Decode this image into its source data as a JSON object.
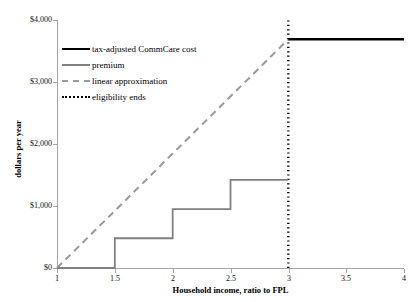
{
  "chart_data": {
    "type": "line",
    "title": "",
    "xlabel": "Household income, ratio to FPL",
    "ylabel": "dollars per year",
    "xlim": [
      1,
      4
    ],
    "ylim": [
      0,
      4000
    ],
    "grid": false,
    "legend_position": "upper-left-inside",
    "x_ticks": [
      "1",
      "1.5",
      "2",
      "2.5",
      "3",
      "3.5",
      "4"
    ],
    "x_tick_values": [
      1,
      1.5,
      2,
      2.5,
      3,
      3.5,
      4
    ],
    "y_ticks": [
      "$0",
      "$1,000",
      "$2,000",
      "$3,000",
      "$4,000"
    ],
    "y_tick_values": [
      0,
      1000,
      2000,
      3000,
      4000
    ],
    "series": [
      {
        "name": "tax-adjusted CommCare cost",
        "style": "solid-thick",
        "color": "#000000",
        "points": [
          [
            3,
            3690
          ],
          [
            4,
            3690
          ]
        ]
      },
      {
        "name": "premium",
        "style": "solid",
        "color": "#808080",
        "points": [
          [
            1,
            0
          ],
          [
            1.5,
            0
          ],
          [
            1.5,
            480
          ],
          [
            2,
            480
          ],
          [
            2,
            950
          ],
          [
            2.5,
            950
          ],
          [
            2.5,
            1420
          ],
          [
            3,
            1420
          ]
        ]
      },
      {
        "name": "linear approximation",
        "style": "dashed",
        "color": "#9a9a9a",
        "points": [
          [
            1,
            0
          ],
          [
            3,
            3690
          ]
        ]
      },
      {
        "name": "eligibility ends",
        "style": "dotted-vertical",
        "color": "#000000",
        "points": [
          [
            3,
            0
          ],
          [
            3,
            4000
          ]
        ]
      }
    ]
  },
  "legend": {
    "items": [
      {
        "label": "tax-adjusted CommCare cost",
        "swatch": "solid-black-line-icon"
      },
      {
        "label": "premium",
        "swatch": "solid-gray-line-icon"
      },
      {
        "label": "linear approximation",
        "swatch": "dashed-gray-line-icon"
      },
      {
        "label": "eligibility ends",
        "swatch": "dotted-black-line-icon"
      }
    ]
  },
  "axes": {
    "y_title": "dollars per year",
    "x_title": "Household income, ratio to FPL",
    "y_labels": [
      "$4,000",
      "$3,000",
      "$2,000",
      "$1,000",
      "$0"
    ],
    "x_labels": [
      "1",
      "1.5",
      "2",
      "2.5",
      "3",
      "3.5",
      "4"
    ]
  }
}
